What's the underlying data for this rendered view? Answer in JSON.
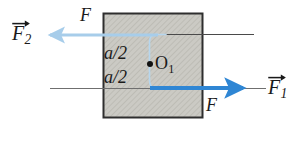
{
  "figure": {
    "canvas": {
      "width": 302,
      "height": 141,
      "background": "#ffffff"
    },
    "block": {
      "name": "hatched-block",
      "x": 103,
      "y": 13,
      "width": 100,
      "height": 105,
      "fill": "#c9c8c2",
      "hatch_color": "#b2b1aa",
      "stroke": "#2e2e2e",
      "stroke_width": 2
    },
    "labels": {
      "force_vector_2": {
        "symbol": "F",
        "subscript": "2",
        "vector": true
      },
      "force_top": {
        "symbol": "F",
        "subscript": "",
        "vector": false
      },
      "dim_upper": {
        "text": "a/2"
      },
      "dim_lower": {
        "text": "a/2"
      },
      "center_point": {
        "symbol": "O",
        "subscript": "1",
        "vector": false
      },
      "force_bottom": {
        "symbol": "F",
        "subscript": "",
        "vector": false
      },
      "force_vector_1": {
        "symbol": "F",
        "subscript": "1",
        "vector": true
      }
    },
    "arrows": {
      "upper": {
        "name": "force-arrow-f2",
        "direction": "left",
        "color": "#a7cdea",
        "x_start": 158,
        "x_end": 44,
        "y": 35,
        "line_width": 3
      },
      "lower": {
        "name": "force-arrow-f1",
        "direction": "right",
        "color": "#2f86d4",
        "x_start": 150,
        "x_end": 249,
        "y": 88,
        "line_width": 4
      }
    },
    "axis_lines": {
      "upper": {
        "name": "upper-action-line",
        "x1": 103,
        "x2": 254,
        "y": 34,
        "color": "#4a4a4a"
      },
      "lower": {
        "name": "lower-action-line",
        "x1": 50,
        "x2": 266,
        "y": 88,
        "color": "#6a6a6a"
      }
    },
    "connector": {
      "name": "couple-connector-curve",
      "color": "#b8d7ef",
      "x": 151,
      "y_top": 34,
      "y_bottom": 88
    },
    "colors": {
      "pale_blue": "#a7cdea",
      "strong_blue": "#2f86d4",
      "block_fill": "#c9c8c2",
      "block_border": "#2e2e2e",
      "ink": "#1a1a1a"
    }
  }
}
